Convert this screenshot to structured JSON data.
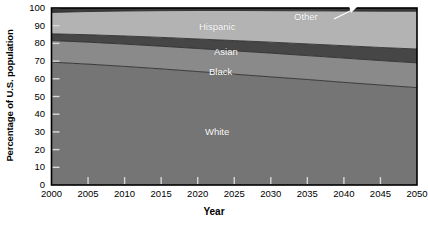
{
  "chart_data": {
    "type": "area",
    "title": "",
    "subtitle": "",
    "xlabel": "Year",
    "ylabel": "Percentage of U.S. population",
    "stacked": true,
    "normalized_to_100": true,
    "grid": false,
    "legend_position": "inline-labels",
    "x": [
      2000,
      2005,
      2010,
      2015,
      2020,
      2025,
      2030,
      2035,
      2040,
      2045,
      2050
    ],
    "xlim": [
      2000,
      2050
    ],
    "ylim": [
      0,
      100
    ],
    "xticks": [
      2000,
      2005,
      2010,
      2015,
      2020,
      2025,
      2030,
      2035,
      2040,
      2045,
      2050
    ],
    "yticks": [
      0,
      10,
      20,
      30,
      40,
      50,
      60,
      70,
      80,
      90,
      100
    ],
    "xtick_labels": [
      "2000",
      "2005",
      "2010",
      "2015",
      "2020",
      "2025",
      "2030",
      "2035",
      "2040",
      "2045",
      "2050"
    ],
    "ytick_labels": [
      "0",
      "10",
      "20",
      "30",
      "40",
      "50",
      "60",
      "70",
      "80",
      "90",
      "100"
    ],
    "series": [
      {
        "name": "White",
        "color": "#757575",
        "label_text": "White",
        "values": [
          69.4,
          68.3,
          67.0,
          65.6,
          64.1,
          62.6,
          61.1,
          59.6,
          58.0,
          56.5,
          55.0
        ]
      },
      {
        "name": "Black",
        "color": "#8a8a8a",
        "label_text": "Black",
        "values": [
          12.2,
          12.4,
          12.6,
          12.8,
          13.0,
          13.2,
          13.4,
          13.5,
          13.7,
          13.8,
          14.0
        ]
      },
      {
        "name": "Asian",
        "color": "#464646",
        "label_text": "Asian",
        "values": [
          3.8,
          4.2,
          4.6,
          5.0,
          5.4,
          5.8,
          6.2,
          6.6,
          7.0,
          7.4,
          7.8
        ]
      },
      {
        "name": "Hispanic",
        "color": "#b3b3b3",
        "label_text": "Hispanic",
        "values": [
          12.1,
          13.1,
          14.1,
          15.1,
          16.1,
          17.0,
          17.8,
          18.7,
          19.6,
          20.5,
          21.4
        ]
      },
      {
        "name": "Other",
        "color": "#3a3a3a",
        "label_text": "Other",
        "values": [
          2.5,
          2.0,
          1.7,
          1.5,
          1.4,
          1.4,
          1.5,
          1.6,
          1.7,
          1.8,
          1.8
        ]
      }
    ],
    "cumulative_top_boundaries": {
      "White": [
        69.4,
        68.3,
        67.0,
        65.6,
        64.1,
        62.6,
        61.1,
        59.6,
        58.0,
        56.5,
        55.0
      ],
      "Black": [
        81.6,
        80.7,
        79.6,
        78.4,
        77.1,
        75.8,
        74.5,
        73.1,
        71.7,
        70.3,
        69.0
      ],
      "Asian": [
        85.4,
        84.9,
        84.2,
        83.4,
        82.5,
        81.6,
        80.7,
        79.7,
        78.7,
        77.7,
        76.8
      ],
      "Hispanic": [
        97.5,
        98.0,
        98.3,
        98.5,
        98.6,
        98.6,
        98.5,
        98.4,
        98.3,
        98.2,
        98.2
      ],
      "Other": [
        100,
        100,
        100,
        100,
        100,
        100,
        100,
        100,
        100,
        100,
        100
      ]
    },
    "annotations": [
      {
        "name": "other-callout",
        "text": "Other",
        "leader_line": true,
        "arrow": true
      }
    ]
  },
  "axes": {
    "ylabel": "Percentage of U.S. population",
    "xlabel": "Year"
  },
  "colors": {
    "white_band": "#757575",
    "black_band": "#8a8a8a",
    "asian_band": "#464646",
    "hispanic_band": "#b3b3b3",
    "other_band": "#3a3a3a",
    "axis": "#000000",
    "label_text": "#ffffff",
    "background": "#ffffff"
  }
}
